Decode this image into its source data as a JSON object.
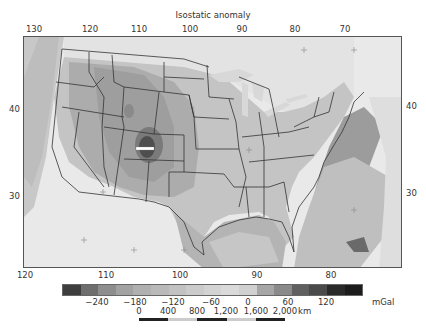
{
  "figure": {
    "title": "Isostatic anomaly"
  },
  "axes": {
    "top_longitude_ticks": [
      {
        "label": "130",
        "x": 34
      },
      {
        "label": "120",
        "x": 90
      },
      {
        "label": "110",
        "x": 139
      },
      {
        "label": "100",
        "x": 190
      },
      {
        "label": "90",
        "x": 242
      },
      {
        "label": "80",
        "x": 295
      },
      {
        "label": "70",
        "x": 345
      }
    ],
    "bottom_longitude_ticks": [
      {
        "label": "120",
        "x": 25
      },
      {
        "label": "110",
        "x": 106
      },
      {
        "label": "100",
        "x": 180
      },
      {
        "label": "90",
        "x": 257
      },
      {
        "label": "80",
        "x": 331
      }
    ],
    "left_latitude_ticks": [
      {
        "label": "40",
        "y": 109
      },
      {
        "label": "30",
        "y": 196
      }
    ],
    "right_latitude_ticks": [
      {
        "label": "40",
        "y": 106
      },
      {
        "label": "30",
        "y": 193
      }
    ]
  },
  "colorbar": {
    "unit": "mGal",
    "colors": [
      "#3e3e3e",
      "#6e6e6e",
      "#8e8e8e",
      "#a2a2a2",
      "#b0b0b0",
      "#b9b9b9",
      "#c2c2c2",
      "#cbcbcb",
      "#d3d3d3",
      "#dadada",
      "#d0d0d0",
      "#a6a6a6",
      "#8a8a8a",
      "#606060",
      "#4a4a4a",
      "#2a2a2a",
      "#1c1c1c"
    ],
    "tick_labels": [
      {
        "label": "−240",
        "x": 97
      },
      {
        "label": "−180",
        "x": 135
      },
      {
        "label": "−120",
        "x": 173
      },
      {
        "label": "−60",
        "x": 211
      },
      {
        "label": "0",
        "x": 248
      },
      {
        "label": "60",
        "x": 288
      },
      {
        "label": "120",
        "x": 326
      }
    ]
  },
  "scale_bar": {
    "unit": "km",
    "labels": [
      {
        "label": "0",
        "x": 139
      },
      {
        "label": "400",
        "x": 168
      },
      {
        "label": "800",
        "x": 197
      },
      {
        "label": "1,200",
        "x": 226
      },
      {
        "label": "1,600",
        "x": 256
      },
      {
        "label": "2,000",
        "x": 285
      }
    ],
    "segment_colors": [
      "#222222",
      "#cccccc",
      "#222222",
      "#cccccc",
      "#222222"
    ]
  },
  "map": {
    "region": "Contiguous United States",
    "marker": "white horizontal bar over Colorado"
  }
}
